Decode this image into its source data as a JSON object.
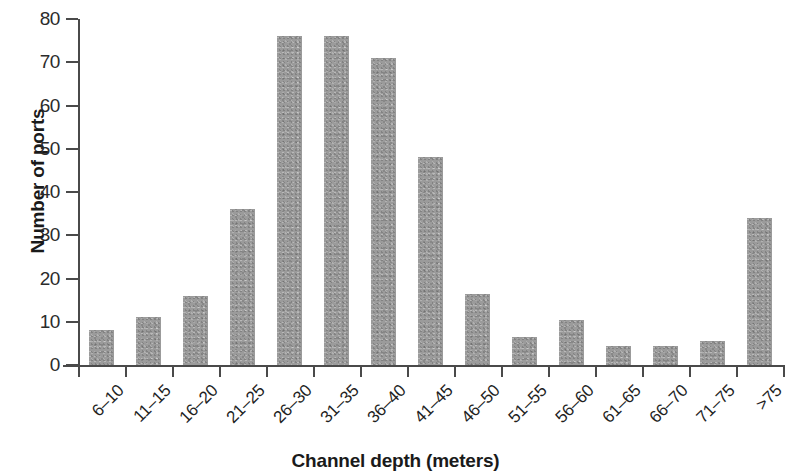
{
  "chart_data": {
    "type": "bar",
    "title": "",
    "xlabel": "Channel depth (meters)",
    "ylabel": "Number of ports",
    "categories": [
      "6–10",
      "11–15",
      "16–20",
      "21–25",
      "26–30",
      "31–35",
      "36–40",
      "41–45",
      "46–50",
      "51–55",
      "56–60",
      "61–65",
      "66–70",
      "71–75",
      ">75"
    ],
    "values": [
      8,
      11,
      16,
      36,
      76,
      76,
      71,
      48,
      16.5,
      6.5,
      10.5,
      4.5,
      4.5,
      5.5,
      34
    ],
    "ylim": [
      0,
      80
    ],
    "yticks": [
      0,
      10,
      20,
      30,
      40,
      50,
      60,
      70,
      80
    ],
    "ytick_labels": [
      "0",
      "10",
      "20",
      "30",
      "40",
      "50",
      "60",
      "70",
      "80"
    ],
    "grid": false,
    "legend": false,
    "bar_color": "#9b9b9b",
    "axis_color": "#4a4a4a"
  }
}
